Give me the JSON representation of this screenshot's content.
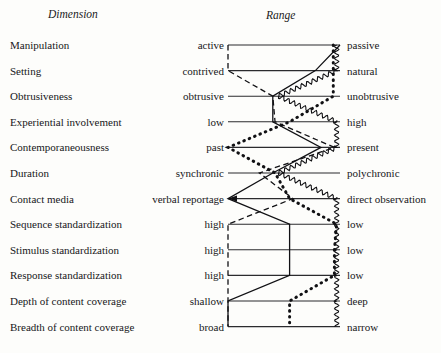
{
  "figure": {
    "headers": {
      "dimension": "Dimension",
      "range": "Range"
    },
    "axis": {
      "left_x": 228,
      "right_x": 340,
      "first_row_y": 45,
      "row_spacing": 25.6
    },
    "rows": [
      {
        "dimension": "Manipulation",
        "left_pole": "active",
        "right_pole": "passive"
      },
      {
        "dimension": "Setting",
        "left_pole": "contrived",
        "right_pole": "natural"
      },
      {
        "dimension": "Obtrusiveness",
        "left_pole": "obtrusive",
        "right_pole": "unobtrusive"
      },
      {
        "dimension": "Experiential involvement",
        "left_pole": "low",
        "right_pole": "high"
      },
      {
        "dimension": "Contemporaneousness",
        "left_pole": "past",
        "right_pole": "present"
      },
      {
        "dimension": "Duration",
        "left_pole": "synchronic",
        "right_pole": "polychronic"
      },
      {
        "dimension": "Contact media",
        "left_pole": "verbal reportage",
        "right_pole": "direct observation"
      },
      {
        "dimension": "Sequence standardization",
        "left_pole": "high",
        "right_pole": "low"
      },
      {
        "dimension": "Stimulus standardization",
        "left_pole": "high",
        "right_pole": "low"
      },
      {
        "dimension": "Response standardization",
        "left_pole": "high",
        "right_pole": "low"
      },
      {
        "dimension": "Depth of content coverage",
        "left_pole": "shallow",
        "right_pole": "deep"
      },
      {
        "dimension": "Breadth of content coverage",
        "left_pole": "broad",
        "right_pole": "narrow"
      }
    ]
  },
  "chart_data": {
    "type": "line",
    "title": "",
    "subtitle": "",
    "xlabel": "Range",
    "ylabel": "Dimension",
    "grid": true,
    "legend_position": "none",
    "axis_scale": {
      "left_value": 0,
      "right_value": 1
    },
    "categories": [
      "Manipulation",
      "Setting",
      "Obtrusiveness",
      "Experiential involvement",
      "Contemporaneousness",
      "Duration",
      "Contact media",
      "Sequence standardization",
      "Stimulus standardization",
      "Response standardization",
      "Depth of content coverage",
      "Breadth of content coverage"
    ],
    "pole_labels_left": [
      "active",
      "contrived",
      "obtrusive",
      "low",
      "past",
      "synchronic",
      "verbal reportage",
      "high",
      "high",
      "high",
      "shallow",
      "broad"
    ],
    "pole_labels_right": [
      "passive",
      "natural",
      "unobtrusive",
      "high",
      "present",
      "polychronic",
      "direct observation",
      "low",
      "low",
      "low",
      "deep",
      "narrow"
    ],
    "series": [
      {
        "name": "solid-profile",
        "style": "solid",
        "values": [
          1.0,
          0.78,
          0.4,
          0.4,
          0.83,
          0.4,
          0.0,
          0.55,
          0.55,
          0.55,
          0.0,
          0.0
        ]
      },
      {
        "name": "dashed-profile",
        "style": "dashed",
        "values": [
          0.0,
          0.0,
          0.4,
          0.42,
          0.95,
          0.28,
          0.58,
          0.0,
          0.0,
          0.0,
          0.0,
          0.0
        ]
      },
      {
        "name": "dotted-profile",
        "style": "dotted",
        "values": [
          0.94,
          0.94,
          0.94,
          0.55,
          0.0,
          0.42,
          0.55,
          0.97,
          0.95,
          0.95,
          0.55,
          0.55
        ]
      },
      {
        "name": "wavy-profile",
        "style": "wavy",
        "values": [
          0.97,
          0.97,
          0.45,
          0.97,
          0.97,
          0.45,
          0.97,
          0.97,
          0.97,
          0.97,
          0.97,
          0.97
        ]
      }
    ]
  }
}
